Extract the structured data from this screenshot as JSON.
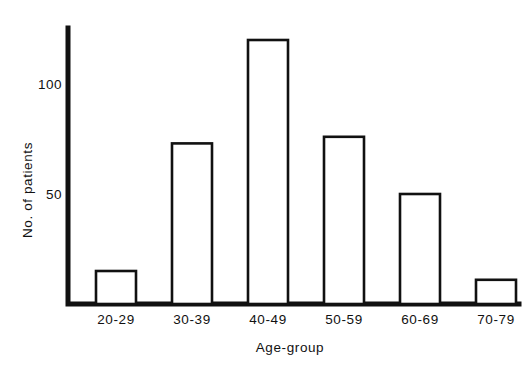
{
  "chart_data": {
    "type": "bar",
    "title": "",
    "subtitle": "",
    "xlabel": "Age-group",
    "ylabel": "No. of patients",
    "categories": [
      "20-29",
      "30-39",
      "40-49",
      "50-59",
      "60-69",
      "70-79"
    ],
    "values": [
      15,
      73,
      120,
      76,
      50,
      11
    ],
    "series": [
      {
        "name": "No. of patients",
        "values": [
          15,
          73,
          120,
          76,
          50,
          11
        ]
      }
    ],
    "ylim": [
      0,
      130
    ],
    "xlim": [
      0,
      6
    ],
    "yticks": [
      50,
      100
    ],
    "ytick_labels": [
      "50",
      "100"
    ],
    "grid": false,
    "legend": false,
    "legend_position": "none",
    "bar_style": {
      "fill_color": "#ffffff",
      "edge_color": "#111111",
      "edge_width": 2.6
    },
    "axis_color": "#111111",
    "background_color": "#ffffff",
    "annotations": []
  },
  "axes": {
    "y_tick_100": "100",
    "y_tick_50": "50",
    "y_title": "No. of patients",
    "x_title": "Age-group"
  },
  "bars": [
    {
      "label": "20-29",
      "value": 15
    },
    {
      "label": "30-39",
      "value": 73
    },
    {
      "label": "40-49",
      "value": 120
    },
    {
      "label": "50-59",
      "value": 76
    },
    {
      "label": "60-69",
      "value": 50
    },
    {
      "label": "70-79",
      "value": 11
    }
  ]
}
